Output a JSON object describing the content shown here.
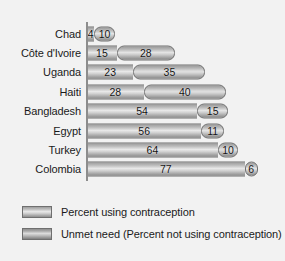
{
  "chart_data": {
    "type": "bar",
    "orientation": "horizontal",
    "stacked": true,
    "title": "",
    "subtitle": "",
    "xlabel": "",
    "ylabel": "",
    "xlim": [
      0,
      90
    ],
    "grid": false,
    "legend_position": "bottom-left",
    "categories": [
      "Chad",
      "Côte d'Ivoire",
      "Uganda",
      "Haiti",
      "Bangladesh",
      "Egypt",
      "Turkey",
      "Colombia"
    ],
    "series": [
      {
        "name": "Percent using contraception",
        "values": [
          4,
          15,
          23,
          28,
          54,
          56,
          64,
          77
        ]
      },
      {
        "name": "Unmet need (Percent not using contraception)",
        "values": [
          10,
          28,
          35,
          40,
          15,
          11,
          10,
          6
        ]
      }
    ],
    "totals": [
      14,
      43,
      58,
      68,
      69,
      67,
      74,
      83
    ],
    "value_labels": [
      {
        "using": "4",
        "unmet": "10"
      },
      {
        "using": "15",
        "unmet": "28"
      },
      {
        "using": "23",
        "unmet": "35"
      },
      {
        "using": "28",
        "unmet": "40"
      },
      {
        "using": "54",
        "unmet": "15"
      },
      {
        "using": "56",
        "unmet": "11"
      },
      {
        "using": "64",
        "unmet": "10"
      },
      {
        "using": "77",
        "unmet": "6"
      }
    ]
  },
  "legend": {
    "items": [
      {
        "label": "Percent using contraception",
        "swatch": "legend-swatch-using"
      },
      {
        "label": "Unmet need (Percent not using contraception)",
        "swatch": "legend-swatch-unmet"
      }
    ]
  },
  "colors": {
    "background": "#f2f2f2",
    "bar_light": "#e8e8e8",
    "bar_mid": "#bdbdbd",
    "bar_dark": "#8f8f8f",
    "bar_outline": "#6f6f6f",
    "axis_line": "#8d8d8d",
    "text": "#1a1a1a"
  }
}
